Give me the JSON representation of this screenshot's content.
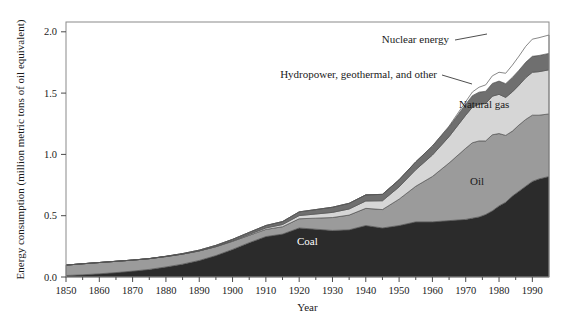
{
  "chart_data": {
    "type": "area",
    "stacked": true,
    "title": "",
    "xlabel": "Year",
    "ylabel": "Energy consumption (million metric tons of oil equivalent)",
    "xlim": [
      1850,
      1995
    ],
    "ylim": [
      0.0,
      2.08
    ],
    "yticks": [
      "0.0",
      "0.5",
      "1.0",
      "1.5",
      "2.0"
    ],
    "ytick_values": [
      0.0,
      0.5,
      1.0,
      1.5,
      2.0
    ],
    "xticks": [
      "1850",
      "1860",
      "1870",
      "1880",
      "1890",
      "1900",
      "1910",
      "1920",
      "1930",
      "1940",
      "1950",
      "1960",
      "1970",
      "1980",
      "1990"
    ],
    "xtick_values": [
      1850,
      1860,
      1870,
      1880,
      1890,
      1900,
      1910,
      1920,
      1930,
      1940,
      1950,
      1960,
      1970,
      1980,
      1990
    ],
    "grid": false,
    "legend_position": "inline-annotations",
    "x": [
      1850,
      1855,
      1860,
      1865,
      1870,
      1875,
      1880,
      1885,
      1890,
      1895,
      1900,
      1905,
      1910,
      1915,
      1920,
      1925,
      1930,
      1935,
      1940,
      1945,
      1950,
      1955,
      1960,
      1965,
      1970,
      1972,
      1974,
      1976,
      1978,
      1980,
      1982,
      1984,
      1986,
      1988,
      1990,
      1992,
      1995
    ],
    "series": [
      {
        "name": "Coal",
        "color": "#2b2b2b",
        "values": [
          0.012,
          0.018,
          0.026,
          0.036,
          0.048,
          0.062,
          0.082,
          0.105,
          0.135,
          0.175,
          0.225,
          0.28,
          0.33,
          0.35,
          0.4,
          0.39,
          0.38,
          0.385,
          0.42,
          0.4,
          0.42,
          0.45,
          0.45,
          0.46,
          0.47,
          0.48,
          0.49,
          0.51,
          0.54,
          0.58,
          0.61,
          0.66,
          0.7,
          0.74,
          0.78,
          0.8,
          0.82
        ]
      },
      {
        "name": "Oil",
        "color": "#9b9b9b",
        "values": [
          0.085,
          0.09,
          0.092,
          0.092,
          0.09,
          0.088,
          0.085,
          0.082,
          0.078,
          0.072,
          0.066,
          0.06,
          0.058,
          0.06,
          0.075,
          0.09,
          0.105,
          0.12,
          0.14,
          0.15,
          0.215,
          0.29,
          0.37,
          0.47,
          0.58,
          0.615,
          0.62,
          0.6,
          0.62,
          0.59,
          0.545,
          0.53,
          0.54,
          0.545,
          0.54,
          0.52,
          0.51
        ]
      },
      {
        "name": "Natural gas",
        "color": "#d6d6d6",
        "values": [
          0.0,
          0.0,
          0.0,
          0.0,
          0.0,
          0.0,
          0.0,
          0.0,
          0.0,
          0.002,
          0.004,
          0.008,
          0.012,
          0.018,
          0.026,
          0.034,
          0.042,
          0.05,
          0.06,
          0.072,
          0.1,
          0.135,
          0.175,
          0.215,
          0.27,
          0.29,
          0.3,
          0.305,
          0.315,
          0.32,
          0.31,
          0.32,
          0.325,
          0.34,
          0.35,
          0.355,
          0.36
        ]
      },
      {
        "name": "Hydropower, geothermal, and other",
        "color": "#6f6f6f",
        "values": [
          0.0,
          0.0,
          0.0,
          0.0,
          0.0,
          0.0,
          0.002,
          0.004,
          0.006,
          0.009,
          0.012,
          0.016,
          0.02,
          0.024,
          0.03,
          0.036,
          0.042,
          0.046,
          0.05,
          0.052,
          0.058,
          0.064,
          0.072,
          0.08,
          0.09,
          0.094,
          0.098,
          0.1,
          0.104,
          0.108,
          0.112,
          0.118,
          0.122,
          0.126,
          0.13,
          0.132,
          0.134
        ]
      },
      {
        "name": "Nuclear energy",
        "color": "#ffffff",
        "values": [
          0.0,
          0.0,
          0.0,
          0.0,
          0.0,
          0.0,
          0.0,
          0.0,
          0.0,
          0.0,
          0.0,
          0.0,
          0.0,
          0.0,
          0.0,
          0.0,
          0.0,
          0.0,
          0.0,
          0.0,
          0.0,
          0.0,
          0.002,
          0.006,
          0.02,
          0.03,
          0.04,
          0.052,
          0.062,
          0.072,
          0.085,
          0.1,
          0.115,
          0.13,
          0.14,
          0.145,
          0.15
        ]
      }
    ],
    "annotations": [
      {
        "label": "Nuclear energy",
        "anchor_x": 1967,
        "anchor_y": 2.0
      },
      {
        "label": "Hydropower, geothermal, and other",
        "anchor_x": 1929,
        "anchor_y": 1.64
      },
      {
        "label": "Natural gas",
        "anchor_x": 1975,
        "anchor_y": 1.33
      },
      {
        "label": "Oil",
        "anchor_x": 1978,
        "anchor_y": 0.78
      },
      {
        "label": "Coal",
        "anchor_x": 1928,
        "anchor_y": 0.2
      }
    ]
  }
}
